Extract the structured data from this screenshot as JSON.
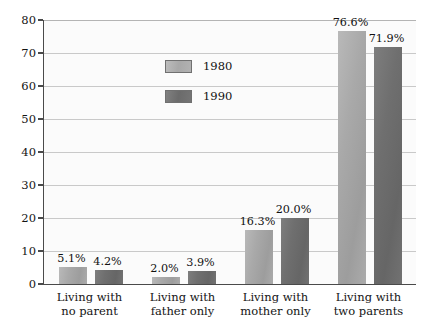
{
  "chart_data": {
    "type": "bar",
    "title": "",
    "xlabel": "",
    "ylabel": "",
    "ylim": [
      0,
      80
    ],
    "grid": true,
    "legend_position": "inside-upper-left",
    "categories": [
      "Living with\nno parent",
      "Living with\nfather only",
      "Living with\nmother only",
      "Living with\ntwo parents"
    ],
    "category_lines": [
      [
        "Living with",
        "no parent"
      ],
      [
        "Living with",
        "father only"
      ],
      [
        "Living with",
        "mother only"
      ],
      [
        "Living with",
        "two parents"
      ]
    ],
    "yticks": [
      0,
      10,
      20,
      30,
      40,
      50,
      60,
      70,
      80
    ],
    "ytick_labels": [
      "0",
      "10",
      "20",
      "30",
      "40",
      "50",
      "60",
      "70",
      "80"
    ],
    "series": [
      {
        "name": "1980",
        "color": "#a9a9a9",
        "values": [
          5.1,
          2.0,
          16.3,
          76.6
        ],
        "value_labels": [
          "5.1%",
          "2.0%",
          "16.3%",
          "76.6%"
        ]
      },
      {
        "name": "1990",
        "color": "#6f6f6f",
        "values": [
          4.2,
          3.9,
          20.0,
          71.9
        ],
        "value_labels": [
          "4.2%",
          "3.9%",
          "20.0%",
          "71.9%"
        ]
      }
    ]
  },
  "legend": {
    "items": [
      {
        "label": "1980",
        "swatch": "s1980"
      },
      {
        "label": "1990",
        "swatch": "s1990"
      }
    ]
  },
  "colors": {
    "series_1980": "#a9a9a9",
    "series_1990": "#6f6f6f",
    "axis": "#4a4a4a",
    "gridline": "#c9c9c9",
    "plot_background": "#fbfbfb",
    "text": "#141414"
  }
}
